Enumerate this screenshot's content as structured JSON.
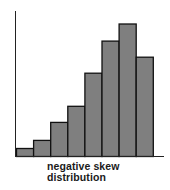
{
  "chart_data": {
    "type": "bar",
    "title": "",
    "xlabel": "negative skew distribution",
    "ylabel": "",
    "categories": [
      "1",
      "2",
      "3",
      "4",
      "5",
      "6",
      "7",
      "8"
    ],
    "values": [
      8,
      16,
      34,
      50,
      83,
      115,
      132,
      99
    ],
    "ylim": [
      0,
      145
    ],
    "grid": false,
    "legend": null,
    "bar_color": "#7f7f7f",
    "edge_color": "#111111",
    "annotation": "negative skew distribution"
  },
  "caption": {
    "line1": "negative skew",
    "line2": "distribution"
  }
}
